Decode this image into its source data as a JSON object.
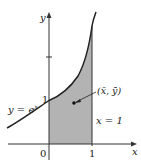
{
  "diagram": {
    "curve_label": "y = e",
    "curve_exponent": "x",
    "centroid_label": "(x̄, ȳ)",
    "vertical_line_label": "x = 1",
    "axis_labels": {
      "x": "x",
      "y": "y"
    },
    "tick_labels": {
      "origin": "0",
      "x_one": "1",
      "y_one": "1"
    },
    "colors": {
      "shade": "#b3b3b3",
      "curve": "#222222",
      "axis": "#333333",
      "background": "#ffffff"
    },
    "curve_function": "e^x",
    "shaded_interval": [
      0,
      1
    ]
  }
}
